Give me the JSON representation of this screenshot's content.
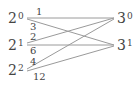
{
  "diagram": {
    "left_nodes": [
      {
        "base": "2",
        "exp": "0"
      },
      {
        "base": "2",
        "exp": "1"
      },
      {
        "base": "2",
        "exp": "2"
      }
    ],
    "right_nodes": [
      {
        "base": "3",
        "exp": "0"
      },
      {
        "base": "3",
        "exp": "1"
      }
    ],
    "edges": [
      {
        "from": "2^0",
        "to": "3^0",
        "label": "1"
      },
      {
        "from": "2^0",
        "to": "3^1",
        "label": "3"
      },
      {
        "from": "2^1",
        "to": "3^0",
        "label": "2"
      },
      {
        "from": "2^1",
        "to": "3^1",
        "label": "6"
      },
      {
        "from": "2^2",
        "to": "3^0",
        "label": "4"
      },
      {
        "from": "2^2",
        "to": "3^1",
        "label": "12"
      }
    ],
    "line_color": "#9a9a9a",
    "text_color": "#444444"
  }
}
